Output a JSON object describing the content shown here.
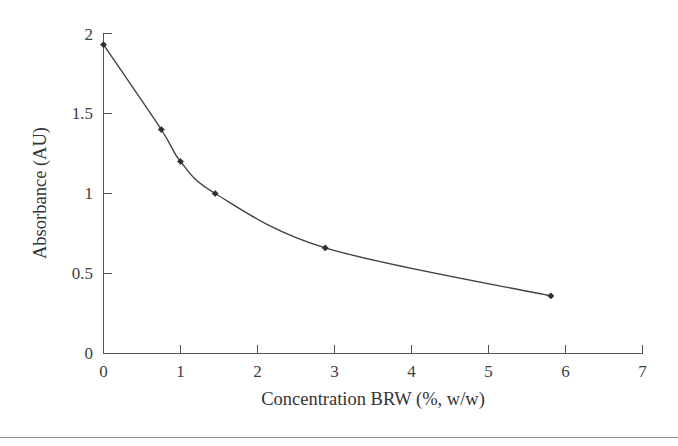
{
  "chart_data": {
    "type": "line",
    "title": "",
    "xlabel": "Concentration BRW (%, w/w)",
    "ylabel": "Absorbance (AU)",
    "xlim": [
      0,
      7
    ],
    "ylim": [
      0,
      2
    ],
    "xticks": [
      "0",
      "1",
      "2",
      "3",
      "4",
      "5",
      "6",
      "7"
    ],
    "xtick_values": [
      0,
      1,
      2,
      3,
      4,
      5,
      6,
      7
    ],
    "yticks": [
      "0",
      "0.5",
      "1",
      "1.5",
      "2"
    ],
    "ytick_values": [
      0,
      0.5,
      1,
      1.5,
      2
    ],
    "grid": false,
    "legend": false,
    "marker": "diamond",
    "line_color": "#40403f",
    "marker_color": "#2f2f2f",
    "axis_color": "#555555",
    "background": "#ffffff",
    "series": [
      {
        "name": "Absorbance vs BRW concentration",
        "x": [
          0,
          0.75,
          1.0,
          1.45,
          2.88,
          5.81
        ],
        "values": [
          1.93,
          1.4,
          1.2,
          1.0,
          0.66,
          0.36
        ]
      }
    ]
  },
  "figure": {
    "bottom_rule_visible": "true"
  }
}
